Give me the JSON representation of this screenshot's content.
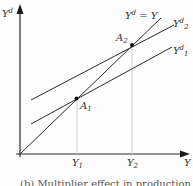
{
  "diagram": {
    "type": "income-expenditure (Keynesian cross)",
    "y_axis_label": {
      "base": "Y",
      "sup": "d"
    },
    "x_axis_label": "Y",
    "lines": [
      {
        "name": "45-degree line",
        "label_base": "Y",
        "label_sup": "d",
        "label_rest": " = Y"
      },
      {
        "name": "demand-2",
        "label_base": "Y",
        "label_sup": "d",
        "label_sub": "2"
      },
      {
        "name": "demand-1",
        "label_base": "Y",
        "label_sup": "d",
        "label_sub": "1"
      }
    ],
    "points": [
      {
        "label_base": "A",
        "label_sub": "1"
      },
      {
        "label_base": "A",
        "label_sub": "2"
      }
    ],
    "x_ticks": [
      {
        "label_base": "Y",
        "label_sub": "1"
      },
      {
        "label_base": "Y",
        "label_sub": "2"
      }
    ],
    "caption": "(b) Multiplier effect in production"
  },
  "colors": {
    "line": "#2a2a2a",
    "guide": "#bdbdbd",
    "text": "#333333"
  }
}
